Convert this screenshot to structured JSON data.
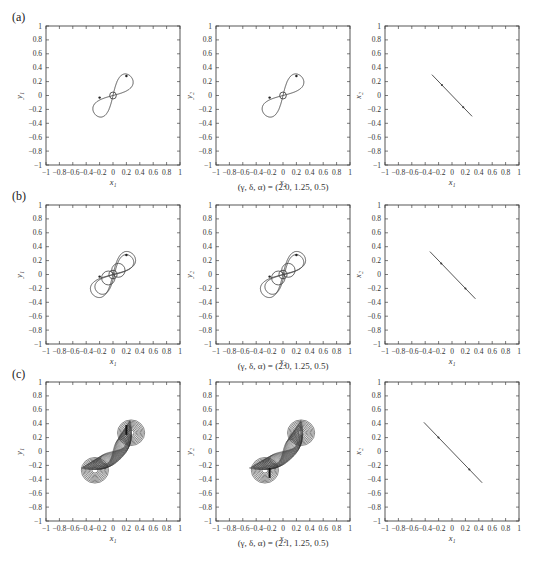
{
  "figure": {
    "rows": [
      {
        "label": "(a)",
        "caption": "(γ, δ, α) = (2.0, 1.25, 0.5)"
      },
      {
        "label": "(b)",
        "caption": "(γ, δ, α) = (2.0, 1.25, 0.5)"
      },
      {
        "label": "(c)",
        "caption": "(γ, δ, α) = (2.1, 1.25, 0.5)"
      }
    ],
    "tick_values": [
      "−1",
      "−0.8",
      "−0.6",
      "−0.4",
      "−0.2",
      "0",
      "0.2",
      "0.4",
      "0.6",
      "0.8",
      "1"
    ],
    "axis_labels": {
      "col1": {
        "x": "x1",
        "y": "y1"
      },
      "col2": {
        "x": "x2",
        "y": "y2"
      },
      "col3": {
        "x": "x1",
        "y": "x2"
      }
    }
  },
  "chart_data": [
    {
      "type": "line",
      "panel": "a-1",
      "title": "",
      "xlabel": "x₁",
      "ylabel": "y₁",
      "xlim": [
        -1,
        1
      ],
      "ylim": [
        -1,
        1
      ],
      "grid": false,
      "description": "figure-eight limit cycle",
      "series": [
        {
          "name": "trajectory",
          "shape": "figure8",
          "extent_x": [
            -0.28,
            0.3
          ],
          "extent_y": [
            -0.3,
            0.3
          ],
          "loops": 1
        }
      ]
    },
    {
      "type": "line",
      "panel": "a-2",
      "title": "",
      "xlabel": "x₂",
      "ylabel": "y₂",
      "xlim": [
        -1,
        1
      ],
      "ylim": [
        -1,
        1
      ],
      "grid": false,
      "description": "figure-eight limit cycle",
      "series": [
        {
          "name": "trajectory",
          "shape": "figure8",
          "extent_x": [
            -0.3,
            0.3
          ],
          "extent_y": [
            -0.3,
            0.3
          ],
          "loops": 1
        }
      ]
    },
    {
      "type": "line",
      "panel": "a-3",
      "title": "",
      "xlabel": "x₁",
      "ylabel": "x₂",
      "xlim": [
        -1,
        1
      ],
      "ylim": [
        -1,
        1
      ],
      "grid": false,
      "series": [
        {
          "name": "sync",
          "x": [
            -0.3,
            0.3
          ],
          "y": [
            0.3,
            -0.3
          ]
        }
      ]
    },
    {
      "type": "line",
      "panel": "b-1",
      "title": "",
      "xlabel": "x₁",
      "ylabel": "y₁",
      "xlim": [
        -1,
        1
      ],
      "ylim": [
        -1,
        1
      ],
      "grid": false,
      "description": "period-doubled figure-eight (two nested loops)",
      "series": [
        {
          "name": "trajectory",
          "shape": "figure8",
          "extent_x": [
            -0.32,
            0.33
          ],
          "extent_y": [
            -0.32,
            0.32
          ],
          "loops": 2
        }
      ]
    },
    {
      "type": "line",
      "panel": "b-2",
      "title": "",
      "xlabel": "x₂",
      "ylabel": "y₂",
      "xlim": [
        -1,
        1
      ],
      "ylim": [
        -1,
        1
      ],
      "grid": false,
      "description": "period-doubled figure-eight (two nested loops)",
      "series": [
        {
          "name": "trajectory",
          "shape": "figure8",
          "extent_x": [
            -0.32,
            0.33
          ],
          "extent_y": [
            -0.32,
            0.32
          ],
          "loops": 2
        }
      ]
    },
    {
      "type": "line",
      "panel": "b-3",
      "title": "",
      "xlabel": "x₁",
      "ylabel": "x₂",
      "xlim": [
        -1,
        1
      ],
      "ylim": [
        -1,
        1
      ],
      "grid": false,
      "series": [
        {
          "name": "sync",
          "x": [
            -0.33,
            0.35
          ],
          "y": [
            0.33,
            -0.35
          ]
        }
      ]
    },
    {
      "type": "line",
      "panel": "c-1",
      "title": "",
      "xlabel": "x₁",
      "ylabel": "y₁",
      "xlim": [
        -1,
        1
      ],
      "ylim": [
        -1,
        1
      ],
      "grid": false,
      "description": "chaotic attractor, dense double-scroll",
      "series": [
        {
          "name": "trajectory",
          "shape": "chaotic",
          "extent_x": [
            -0.4,
            0.45
          ],
          "extent_y": [
            -0.4,
            0.4
          ],
          "loops": 14
        }
      ]
    },
    {
      "type": "line",
      "panel": "c-2",
      "title": "",
      "xlabel": "x₂",
      "ylabel": "y₂",
      "xlim": [
        -1,
        1
      ],
      "ylim": [
        -1,
        1
      ],
      "grid": false,
      "description": "chaotic attractor, dense double-scroll",
      "series": [
        {
          "name": "trajectory",
          "shape": "chaotic",
          "extent_x": [
            -0.45,
            0.45
          ],
          "extent_y": [
            -0.4,
            0.4
          ],
          "loops": 14
        }
      ]
    },
    {
      "type": "line",
      "panel": "c-3",
      "title": "",
      "xlabel": "x₁",
      "ylabel": "x₂",
      "xlim": [
        -1,
        1
      ],
      "ylim": [
        -1,
        1
      ],
      "grid": false,
      "series": [
        {
          "name": "sync",
          "x": [
            -0.42,
            0.45
          ],
          "y": [
            0.42,
            -0.45
          ]
        }
      ]
    }
  ]
}
